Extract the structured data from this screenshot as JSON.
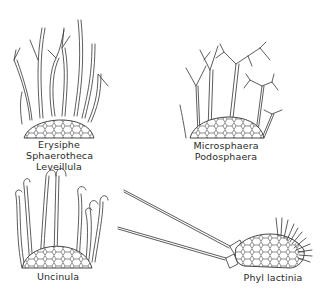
{
  "figure": {
    "type": "line-drawing illustration",
    "background": "#ffffff",
    "ink_color": "#333333"
  },
  "panels": [
    {
      "id": "top-left",
      "appendage_type": "mycelioid, sparsely branched",
      "labels": [
        "Erysiphe",
        "Sphaerotheca",
        "Leveillula"
      ]
    },
    {
      "id": "top-right",
      "appendage_type": "dichotomously branched tips",
      "labels": [
        "Microsphaera",
        "Podosphaera"
      ]
    },
    {
      "id": "bottom-left",
      "appendage_type": "uncinate (hooked) tips",
      "labels": [
        "Uncinula"
      ]
    },
    {
      "id": "bottom-right",
      "appendage_type": "acicular with bulbous base; penicillate cells",
      "labels": [
        "Phyl lactinia"
      ]
    }
  ]
}
